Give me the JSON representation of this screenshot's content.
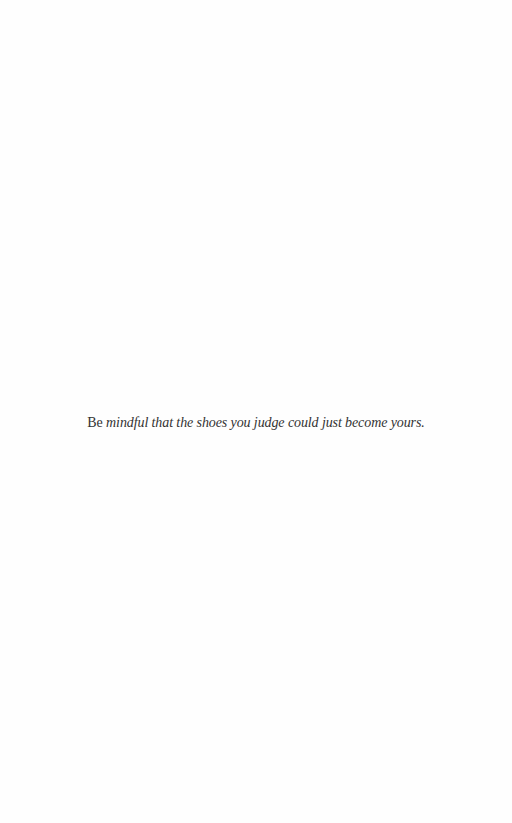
{
  "page": {
    "background": "#fefefe",
    "text_color": "#333333"
  },
  "epigraph": {
    "lead": "Be",
    "rest": " mindful that the shoes you judge could just become yours."
  }
}
